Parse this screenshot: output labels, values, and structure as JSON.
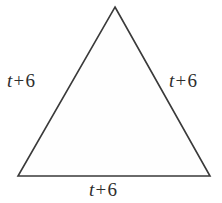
{
  "figure": {
    "name": "equilateral-triangle-with-side-labels",
    "shape": "triangle",
    "stroke_color": "#3a3a3a",
    "fill_color": "#fefefe",
    "background_color": "#ffffff",
    "stroke_width": 1.6,
    "vertices": {
      "apex": {
        "x": 115,
        "y": 7
      },
      "bottom_left": {
        "x": 18,
        "y": 176
      },
      "bottom_right": {
        "x": 210,
        "y": 176
      }
    }
  },
  "labels": {
    "left": {
      "variable": "t",
      "operator": "+",
      "constant": "6",
      "full": "t + 6"
    },
    "right": {
      "variable": "t",
      "operator": "+",
      "constant": "6",
      "full": "t + 6"
    },
    "bottom": {
      "variable": "t",
      "operator": "+",
      "constant": "6",
      "full": "t + 6"
    }
  }
}
